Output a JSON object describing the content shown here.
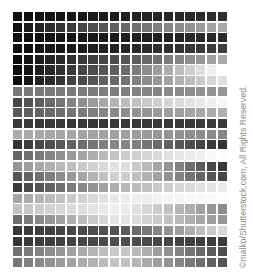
{
  "image": {
    "description": "Grayscale grid of squares with horizontal gradient rows",
    "columns": 20,
    "rows": 24
  },
  "grid_rows": [
    {
      "left": 16,
      "mid": 30,
      "right": 48
    },
    {
      "left": 18,
      "mid": 100,
      "right": 170
    },
    {
      "left": 14,
      "mid": 28,
      "right": 44
    },
    {
      "left": 14,
      "mid": 36,
      "right": 62
    },
    {
      "left": 14,
      "mid": 80,
      "right": 170
    },
    {
      "left": 12,
      "mid": 100,
      "right": 255
    },
    {
      "left": 12,
      "mid": 110,
      "right": 225
    },
    {
      "left": 120,
      "mid": 125,
      "right": 150
    },
    {
      "left": 70,
      "mid": 185,
      "right": 245
    },
    {
      "left": 90,
      "mid": 140,
      "right": 175
    },
    {
      "left": 58,
      "mid": 55,
      "right": 60
    },
    {
      "left": 170,
      "mid": 160,
      "right": 135
    },
    {
      "left": 52,
      "mid": 140,
      "right": 50
    },
    {
      "left": 100,
      "mid": 200,
      "right": 252
    },
    {
      "left": 150,
      "mid": 230,
      "right": 55
    },
    {
      "left": 85,
      "mid": 215,
      "right": 70
    },
    {
      "left": 60,
      "mid": 180,
      "right": 235
    },
    {
      "left": 165,
      "mid": 235,
      "right": 252
    },
    {
      "left": 195,
      "mid": 240,
      "right": 140
    },
    {
      "left": 110,
      "mid": 232,
      "right": 150
    },
    {
      "left": 55,
      "mid": 85,
      "right": 215
    },
    {
      "left": 55,
      "mid": 78,
      "right": 58
    },
    {
      "left": 112,
      "mid": 205,
      "right": 78
    },
    {
      "left": 120,
      "mid": 200,
      "right": 85
    }
  ],
  "watermark": {
    "text": "©malko/Shutterstock.com, All Rights Reserved."
  }
}
